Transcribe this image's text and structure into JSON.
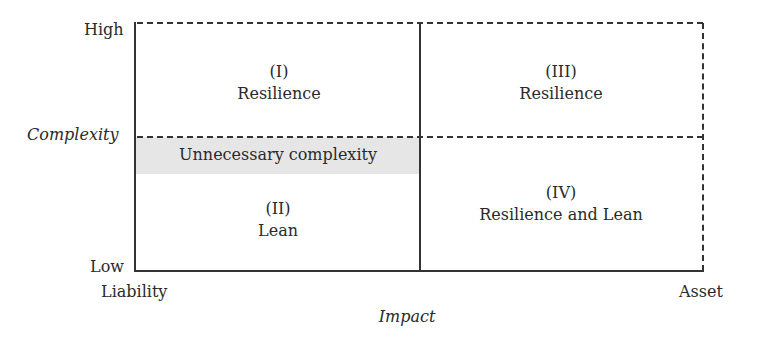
{
  "diagram": {
    "y_axis": {
      "title": "Complexity",
      "high_label": "High",
      "low_label": "Low"
    },
    "x_axis": {
      "title": "Impact",
      "left_label": "Liability",
      "right_label": "Asset"
    },
    "quadrants": [
      {
        "numeral": "(I)",
        "label": "Resilience"
      },
      {
        "numeral": "(II)",
        "label": "Lean"
      },
      {
        "numeral": "(III)",
        "label": "Resilience"
      },
      {
        "numeral": "(IV)",
        "label": "Resilience and Lean"
      }
    ],
    "band_label": "Unnecessary complexity",
    "colors": {
      "line": "#333333",
      "band": "#e6e6e6"
    }
  }
}
